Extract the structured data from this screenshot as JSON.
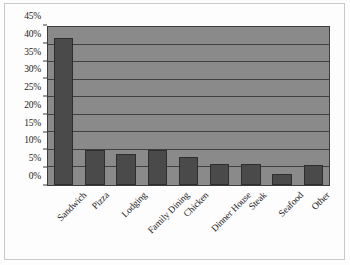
{
  "chart_data": {
    "type": "bar",
    "title": "",
    "subtitle": "",
    "xlabel": "",
    "ylabel": "",
    "categories": [
      "Sandwich",
      "Pizza",
      "Lodging",
      "Family Dining",
      "Chicken",
      "Dinner House",
      "Steak",
      "Seafood",
      "Other"
    ],
    "values": [
      42,
      10,
      8.8,
      10,
      8,
      6,
      6,
      3,
      5.7
    ],
    "value_suffix": "%",
    "ylim": [
      0,
      45
    ],
    "ytick_values": [
      0,
      5,
      10,
      15,
      20,
      25,
      30,
      35,
      40,
      45
    ],
    "ytick_labels": [
      "0%",
      "5%",
      "10%",
      "15%",
      "20%",
      "25%",
      "30%",
      "35%",
      "40%",
      "45%"
    ],
    "grid": true,
    "grid_axis": "y",
    "legend": false,
    "legend_position": "none",
    "bar_color": "#4a4a4a",
    "plot_background": "#8a8a8a",
    "gridline_color": "#3f3f3f",
    "axis_color": "#3c3c3c",
    "figure_background": "#fdfdfd",
    "text_color": "#1c1c1c",
    "xtick_rotation": -45
  }
}
